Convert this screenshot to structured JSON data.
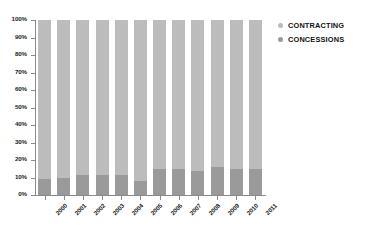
{
  "chart_data": {
    "type": "bar",
    "subtype": "100% stacked bar",
    "title": "",
    "subtitle": "",
    "xlabel": "",
    "ylabel": "",
    "ylim": [
      0,
      100
    ],
    "grid": false,
    "legend_position": "right",
    "categories": [
      "2000",
      "2001",
      "2002",
      "2003",
      "2004",
      "2005",
      "2006",
      "2007",
      "2008",
      "2009",
      "2010",
      "2011"
    ],
    "y_tick_labels": [
      "0%",
      "10%",
      "20%",
      "30%",
      "40%",
      "50%",
      "60%",
      "70%",
      "80%",
      "90%",
      "100%"
    ],
    "y_tick_values": [
      0,
      10,
      20,
      30,
      40,
      50,
      60,
      70,
      80,
      90,
      100
    ],
    "series": [
      {
        "name": "CONTRACTING",
        "color": "#bcbcbc",
        "values": [
          91,
          90,
          88.5,
          88.5,
          88.5,
          92,
          85,
          85,
          86,
          84,
          85,
          85
        ]
      },
      {
        "name": "CONCESSIONS",
        "color": "#9a9a9a",
        "values": [
          9,
          10,
          11.5,
          11.5,
          11.5,
          8,
          15,
          15,
          14,
          16,
          15,
          15
        ]
      }
    ]
  },
  "legend": {
    "items": [
      {
        "label": "CONTRACTING",
        "marker": "legend-dot-contracting"
      },
      {
        "label": "CONCESSIONS",
        "marker": "legend-dot-concessions"
      }
    ]
  },
  "colors": {
    "contracting": "#bcbcbc",
    "concessions": "#9a9a9a",
    "axis": "#8a8a8a",
    "text": "#1a1a1a",
    "background": "#ffffff"
  }
}
